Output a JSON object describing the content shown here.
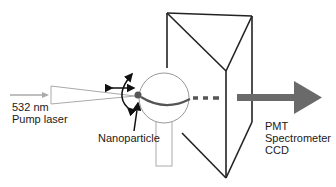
{
  "diagram": {
    "labels": {
      "pump": [
        "532 nm",
        "Pump laser"
      ],
      "nanoparticle": "Nanoparticle",
      "detectors": [
        "PMT",
        "Spectrometer",
        "CCD"
      ]
    },
    "colors": {
      "line": "#222222",
      "light_gray": "#aaaaaa",
      "beam": "#666666",
      "particle": "#555555",
      "outline": "#999999"
    }
  }
}
